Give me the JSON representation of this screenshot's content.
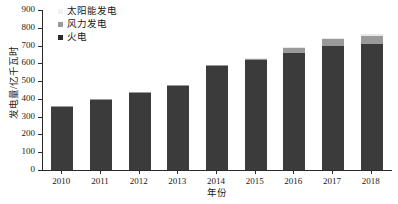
{
  "chart_data": {
    "type": "bar",
    "stacked": true,
    "title": "",
    "xlabel": "年份",
    "ylabel": "发电量/亿千瓦时",
    "categories": [
      "2010",
      "2011",
      "2012",
      "2013",
      "2014",
      "2015",
      "2016",
      "2017",
      "2018"
    ],
    "ylim": [
      0,
      900
    ],
    "ytick_labels": [
      "0",
      "100",
      "200",
      "300",
      "400",
      "500",
      "600",
      "700",
      "800",
      "900"
    ],
    "ytick_values": [
      0,
      100,
      200,
      300,
      400,
      500,
      600,
      700,
      800,
      900
    ],
    "grid": false,
    "legend_position": "upper-left-inside",
    "series": [
      {
        "name": "火电",
        "color": "#3b3b3b",
        "legend_swatch_color": "#2b2b2b",
        "values": [
          355,
          395,
          437,
          473,
          585,
          617,
          660,
          700,
          710
        ]
      },
      {
        "name": "风力发电",
        "color": "#9a9a9a",
        "legend_swatch_color": "#9a9a9a",
        "values": [
          2,
          3,
          4,
          5,
          6,
          8,
          25,
          38,
          45
        ]
      },
      {
        "name": "太阳能发电",
        "color": "#e8e8e8",
        "legend_swatch_color": "#f2f2f2",
        "values": [
          0,
          0,
          0,
          0,
          0,
          1,
          2,
          5,
          8
        ]
      }
    ],
    "totals": [
      357,
      398,
      441,
      478,
      591,
      626,
      687,
      743,
      763
    ]
  },
  "axis": {
    "y_title": "发电量/亿千瓦时",
    "x_title": "年份"
  },
  "legend": {
    "items": [
      {
        "label": "太阳能发电"
      },
      {
        "label": "风力发电"
      },
      {
        "label": "火电"
      }
    ]
  }
}
